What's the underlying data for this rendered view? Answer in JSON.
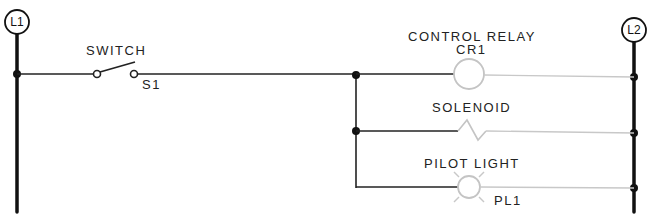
{
  "diagram": {
    "type": "ladder",
    "rails": {
      "left": {
        "label": "L1"
      },
      "right": {
        "label": "L2"
      }
    },
    "components": {
      "switch": {
        "name": "SWITCH",
        "tag": "S1"
      },
      "relay": {
        "name": "CONTROL RELAY",
        "tag": "CR1"
      },
      "solenoid": {
        "name": "SOLENOID"
      },
      "pilot_light": {
        "name": "PILOT LIGHT",
        "tag": "PL1"
      }
    },
    "colors": {
      "energized_wire": "#1a1a1a",
      "deenergized_wire": "#c8c8c8"
    }
  }
}
